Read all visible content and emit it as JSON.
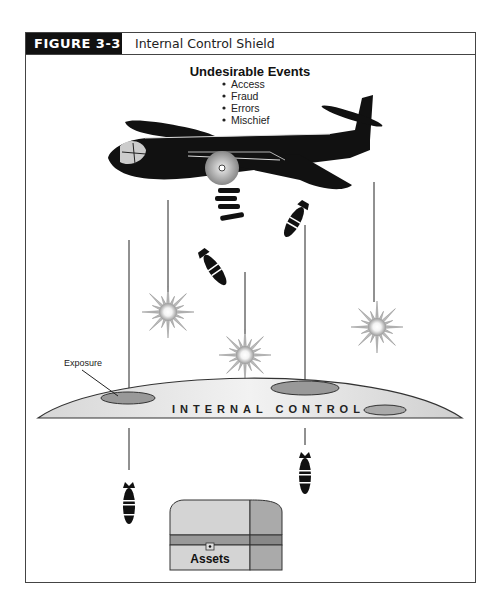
{
  "figure": {
    "label": "FIGURE 3-3",
    "title": "Internal Control Shield"
  },
  "events": {
    "heading": "Undesirable Events",
    "items": [
      "Access",
      "Fraud",
      "Errors",
      "Mischief"
    ]
  },
  "shield": {
    "label": "INTERNAL CONTROL",
    "exposure_label": "Exposure"
  },
  "assets": {
    "label": "Assets"
  }
}
